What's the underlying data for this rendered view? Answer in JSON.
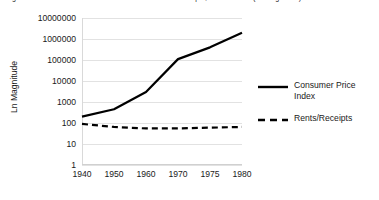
{
  "chart_title": "Figure 4.  Growth in Consumer Price Index and Rents/Receipts, 1940 to 1980 (Ln Magnitude)",
  "chart_data": {
    "type": "line",
    "title": "Figure 4.  Growth in Consumer Price Index and Rents/Receipts, 1940 to 1980 (Ln Magnitude)",
    "xlabel": "",
    "ylabel": "Ln Magnitude",
    "scale": "log10",
    "grid": true,
    "legend_position": "right",
    "categories": [
      "1940",
      "1950",
      "1960",
      "1970",
      "1975",
      "1980"
    ],
    "ytick_labels": [
      "10000000",
      "1000000",
      "100000",
      "10000",
      "1000",
      "100",
      "10",
      "1"
    ],
    "ytick_values": [
      10000000,
      1000000,
      100000,
      10000,
      1000,
      100,
      10,
      1
    ],
    "ylim": [
      1,
      10000000
    ],
    "series": [
      {
        "name": "Consumer Price Index",
        "style": "solid",
        "color": "#000000",
        "values": [
          200,
          450,
          3000,
          110000,
          400000,
          2000000
        ]
      },
      {
        "name": "Rents/Receipts",
        "style": "dashed",
        "color": "#000000",
        "values": [
          90,
          65,
          55,
          55,
          60,
          65
        ]
      }
    ]
  },
  "legend": {
    "entries": [
      {
        "label": "Consumer Price Index",
        "key_icon": "solid-line-icon"
      },
      {
        "label": "Rents/Receipts",
        "key_icon": "dashed-line-icon"
      }
    ]
  }
}
